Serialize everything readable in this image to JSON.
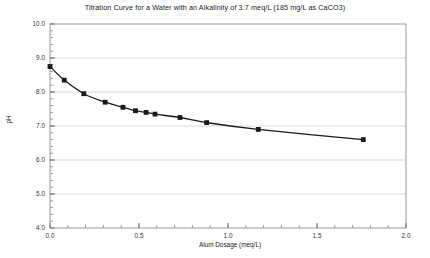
{
  "chart_data": {
    "type": "line",
    "title": "Titration Curve for a Water with an Alkalinity of 3.7 meq/L (185 mg/L as CaCO3)",
    "xlabel": "Alum Dosage (meq/L)",
    "ylabel": "pH",
    "xlim": [
      0.0,
      2.0
    ],
    "ylim": [
      4.0,
      10.0
    ],
    "xticks": [
      0.0,
      0.5,
      1.0,
      1.5,
      2.0
    ],
    "xtick_labels": [
      "0.0",
      "0.5",
      "1.0",
      "1.5",
      "2.0"
    ],
    "yticks": [
      4.0,
      5.0,
      6.0,
      7.0,
      8.0,
      9.0,
      10.0
    ],
    "ytick_labels": [
      "4.0",
      "5.0",
      "6.0",
      "7.0",
      "8.0",
      "9.0",
      "10.0"
    ],
    "x_minor_tick_interval": 0.1,
    "y_minor_tick_interval": 0.2,
    "grid": "horizontal-major",
    "legend": "none",
    "series": [
      {
        "name": "Titration curve",
        "marker": "square",
        "marker_color": "#1a1a1a",
        "line_color": "#1a1a1a",
        "x": [
          0.0,
          0.08,
          0.19,
          0.31,
          0.41,
          0.48,
          0.54,
          0.59,
          0.73,
          0.88,
          1.17,
          1.76
        ],
        "y": [
          8.75,
          8.35,
          7.95,
          7.7,
          7.55,
          7.45,
          7.4,
          7.35,
          7.25,
          7.1,
          6.9,
          6.6
        ]
      }
    ],
    "colors": {
      "background": "#ffffff",
      "axis": "#808080",
      "grid": "#d9d9d9",
      "text": "#222222",
      "data": "#1a1a1a"
    }
  }
}
